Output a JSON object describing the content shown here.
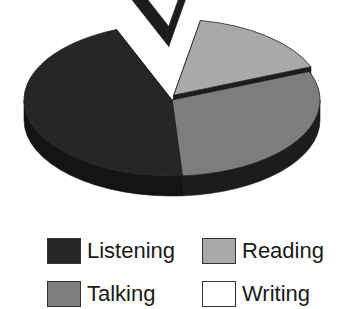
{
  "chart_data": {
    "type": "pie",
    "style": "3d-exploded",
    "title": "",
    "slices": [
      {
        "label": "Writing",
        "value": 9,
        "color": "#ffffff",
        "side_color": "#1c1c1c",
        "exploded": true
      },
      {
        "label": "Reading",
        "value": 16,
        "color": "#a9a9a9",
        "side_color": "#1c1c1c",
        "exploded": true
      },
      {
        "label": "Talking",
        "value": 30,
        "color": "#7d7d7d",
        "side_color": "#1c1c1c",
        "exploded": false
      },
      {
        "label": "Listening",
        "value": 45,
        "color": "#262626",
        "side_color": "#141414",
        "exploded": false
      }
    ],
    "legend": {
      "placement": "bottom",
      "columns": 2,
      "entries": [
        {
          "label": "Listening",
          "color": "#262626"
        },
        {
          "label": "Reading",
          "color": "#a9a9a9"
        },
        {
          "label": "Talking",
          "color": "#7d7d7d"
        },
        {
          "label": "Writing",
          "color": "#ffffff"
        }
      ]
    },
    "units": "percent"
  }
}
